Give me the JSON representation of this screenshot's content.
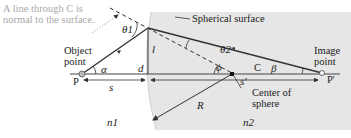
{
  "figure": {
    "annotation": "A line through C is normal to the surface.",
    "annotation_lines": [
      "A line through C is",
      "normal to the surface."
    ],
    "surface_label": "Spherical surface",
    "object_point": {
      "label_lines": [
        "Object",
        "point"
      ],
      "letter": "P"
    },
    "image_point": {
      "label_lines": [
        "Image",
        "point"
      ],
      "letter": "P'"
    },
    "center": {
      "letter": "C",
      "label_lines": [
        "Center of",
        "sphere"
      ]
    },
    "symbols": {
      "theta1": "θ1",
      "theta2": "θ2",
      "alpha": "α",
      "beta": "β",
      "phi": "ϕ",
      "l": "l",
      "d": "d",
      "s": "s",
      "s_prime": "s'",
      "R": "R",
      "n1": "n1",
      "n2": "n2"
    },
    "colors": {
      "medium2_fill": "#e6e6e6",
      "ray": "#333333",
      "annotation_text": "#a8a8a8",
      "axis": "#444444"
    }
  }
}
